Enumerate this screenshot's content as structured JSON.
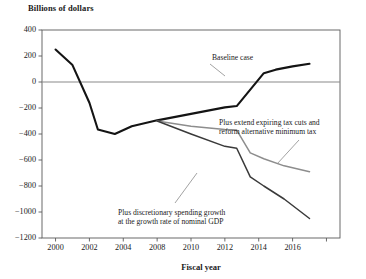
{
  "chart_data": {
    "type": "line",
    "title": "Billions of dollars",
    "xlabel": "Fiscal year",
    "ylabel": "Billions of dollars",
    "xlim": [
      1999.2,
      2016.8
    ],
    "ylim": [
      -1200,
      400
    ],
    "yticks": [
      400,
      200,
      0,
      -200,
      -400,
      -600,
      -800,
      -1000,
      -1200
    ],
    "ytick_labels": [
      "400",
      "200",
      "0",
      "−200",
      "−400",
      "−600",
      "−800",
      "−1000",
      "−1200"
    ],
    "xticks": [
      2000,
      2002,
      2004,
      2006,
      2008,
      2010,
      2012,
      2014,
      2016
    ],
    "xtick_labels": [
      "2000",
      "2002",
      "2004",
      "2008",
      "2010",
      "2012",
      "2014",
      "2016"
    ],
    "grid": false,
    "zero_line": true,
    "legend": "annotations",
    "series": [
      {
        "name": "Baseline case",
        "color": "#141414",
        "width": 2.1,
        "x": [
          2000,
          2001,
          2002,
          2002.5,
          2003.5,
          2004.5,
          2006,
          2008,
          2010,
          2010.7,
          2012.3,
          2013,
          2014,
          2015
        ],
        "y": [
          250,
          130,
          -160,
          -365,
          -400,
          -340,
          -295,
          -245,
          -195,
          -185,
          68,
          95,
          120,
          140
        ]
      },
      {
        "name": "Plus extend expiring tax cuts and reform alternative minimum tax",
        "color": "#8d8d8d",
        "width": 1.5,
        "x": [
          2006,
          2008,
          2010,
          2010.7,
          2011.5,
          2012.3,
          2013.5,
          2015
        ],
        "y": [
          -300,
          -340,
          -365,
          -370,
          -545,
          -590,
          -645,
          -690
        ]
      },
      {
        "name": "Plus discretionary spending growth at the growth rate of nominal GDP",
        "color": "#3a3a3a",
        "width": 1.5,
        "x": [
          2006,
          2008,
          2010,
          2010.7,
          2011.5,
          2012.3,
          2013.5,
          2015
        ],
        "y": [
          -300,
          -400,
          -495,
          -510,
          -730,
          -800,
          -900,
          -1050
        ]
      }
    ],
    "annotations": [
      {
        "id": "baseline-case",
        "lines": [
          "Baseline case"
        ],
        "text_x": 212,
        "text_y": 53,
        "leader": [
          [
            210,
            64
          ],
          [
            225,
            76
          ]
        ]
      },
      {
        "id": "extend-tax-cuts",
        "lines": [
          "Plus extend expiring tax cuts and",
          "reform alternative minimum tax"
        ],
        "text_x": 219,
        "text_y": 118,
        "leader": [
          [
            299,
            140
          ],
          [
            277,
            164
          ]
        ]
      },
      {
        "id": "discretionary-spending",
        "lines": [
          "Plus discretionary spending growth",
          "at the growth rate of nominal GDP"
        ],
        "text_x": 118,
        "text_y": 208,
        "leader": [
          [
            175,
            203
          ],
          [
            197,
            173
          ]
        ]
      }
    ]
  },
  "plot_box": {
    "left": 42,
    "top": 30,
    "right": 340,
    "bottom": 238
  }
}
